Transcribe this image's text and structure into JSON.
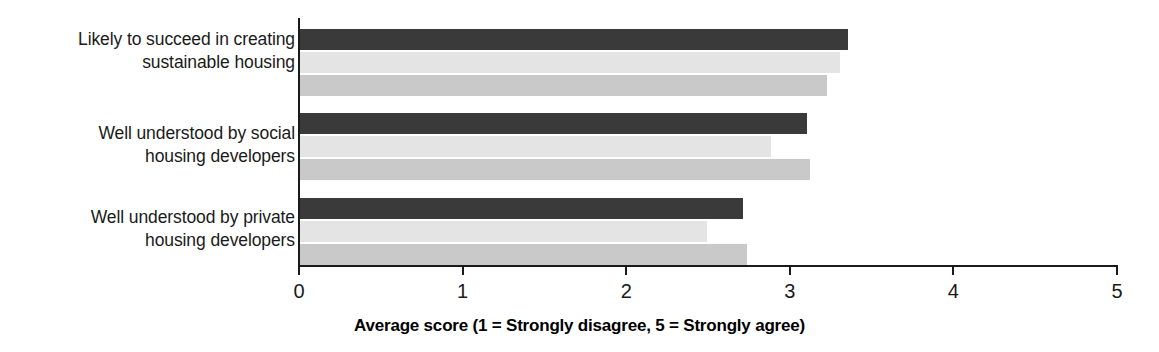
{
  "chart_data": {
    "type": "bar",
    "orientation": "horizontal",
    "title": "",
    "xlabel": "Average score (1 = Strongly disagree, 5 = Strongly agree)",
    "ylabel": "",
    "xlim": [
      0,
      5
    ],
    "xticks": [
      0,
      1,
      2,
      3,
      4,
      5
    ],
    "xtick_labels": [
      "0",
      "1",
      "2",
      "3",
      "4",
      "5"
    ],
    "grid": false,
    "legend": "none",
    "categories": [
      "Likely to succeed in creating\nsustainable housing",
      "Well understood by social\nhousing developers",
      "Well understood by private\nhousing developers"
    ],
    "series": [
      {
        "name": "Series 1",
        "color": "#3a3a3a",
        "values": [
          3.35,
          3.1,
          2.71
        ]
      },
      {
        "name": "Series 2",
        "color": "#e4e4e4",
        "values": [
          3.3,
          2.88,
          2.49
        ]
      },
      {
        "name": "Series 3",
        "color": "#c9c9c9",
        "values": [
          3.22,
          3.12,
          2.73
        ]
      }
    ]
  },
  "axis": {
    "title": "Average score (1 = Strongly disagree, 5 = Strongly agree)"
  },
  "colors": {
    "series_dark": "#3a3a3a",
    "series_light": "#e4e4e4",
    "series_medium": "#c9c9c9",
    "axis": "#1a1a1a",
    "background": "#ffffff"
  }
}
